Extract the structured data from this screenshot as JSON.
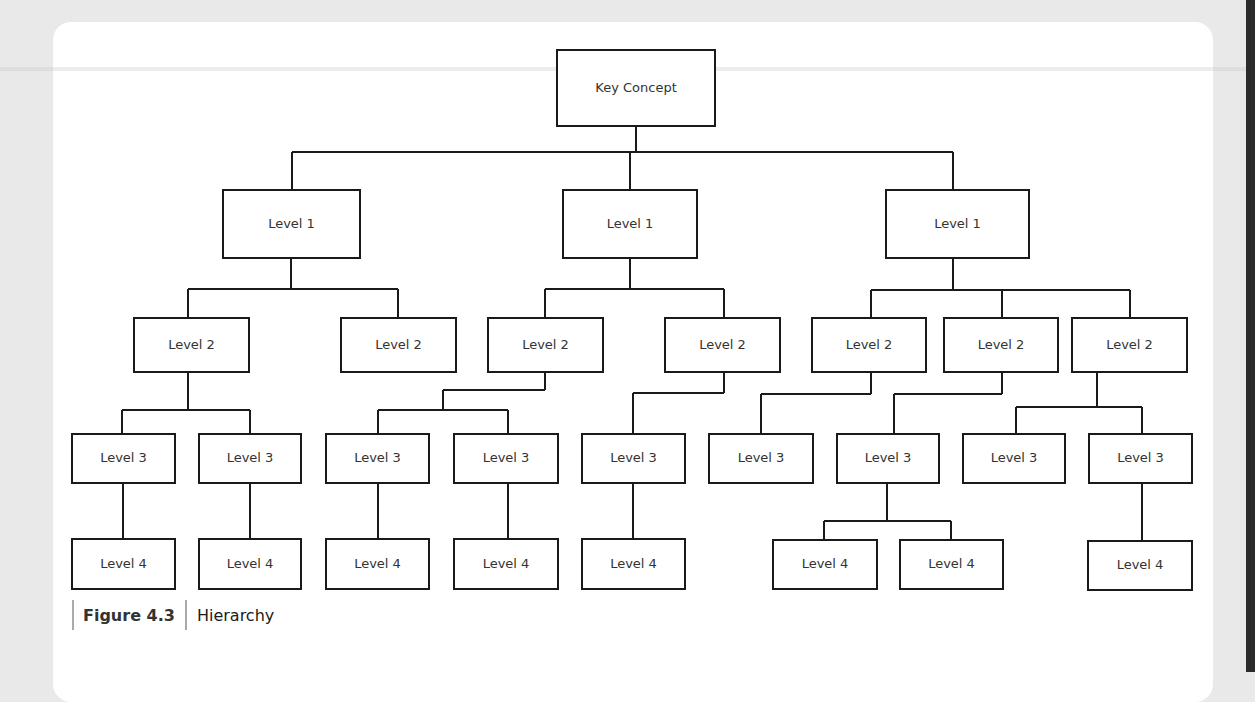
{
  "figure": {
    "label": "Figure 4.3",
    "title": "Hierarchy"
  },
  "diagram": {
    "type": "hierarchy",
    "nodes": [
      {
        "id": "k",
        "label": "Key Concept",
        "x": 557,
        "y": 50,
        "w": 158,
        "h": 76
      },
      {
        "id": "a1",
        "label": "Level 1",
        "x": 223,
        "y": 190,
        "w": 137,
        "h": 68
      },
      {
        "id": "b1",
        "label": "Level 1",
        "x": 563,
        "y": 190,
        "w": 134,
        "h": 68
      },
      {
        "id": "c1",
        "label": "Level 1",
        "x": 886,
        "y": 190,
        "w": 143,
        "h": 68
      },
      {
        "id": "a2a",
        "label": "Level 2",
        "x": 134,
        "y": 318,
        "w": 115,
        "h": 54
      },
      {
        "id": "a2b",
        "label": "Level 2",
        "x": 341,
        "y": 318,
        "w": 115,
        "h": 54
      },
      {
        "id": "b2a",
        "label": "Level 2",
        "x": 488,
        "y": 318,
        "w": 115,
        "h": 54
      },
      {
        "id": "b2b",
        "label": "Level 2",
        "x": 665,
        "y": 318,
        "w": 115,
        "h": 54
      },
      {
        "id": "c2a",
        "label": "Level 2",
        "x": 812,
        "y": 318,
        "w": 114,
        "h": 54
      },
      {
        "id": "c2b",
        "label": "Level 2",
        "x": 944,
        "y": 318,
        "w": 114,
        "h": 54
      },
      {
        "id": "c2c",
        "label": "Level 2",
        "x": 1072,
        "y": 318,
        "w": 115,
        "h": 54
      },
      {
        "id": "a3a",
        "label": "Level 3",
        "x": 72,
        "y": 434,
        "w": 103,
        "h": 49
      },
      {
        "id": "a3b",
        "label": "Level 3",
        "x": 199,
        "y": 434,
        "w": 102,
        "h": 49
      },
      {
        "id": "b3a",
        "label": "Level 3",
        "x": 326,
        "y": 434,
        "w": 103,
        "h": 49
      },
      {
        "id": "b3b",
        "label": "Level 3",
        "x": 454,
        "y": 434,
        "w": 104,
        "h": 49
      },
      {
        "id": "b3c",
        "label": "Level 3",
        "x": 582,
        "y": 434,
        "w": 103,
        "h": 49
      },
      {
        "id": "c3a",
        "label": "Level 3",
        "x": 709,
        "y": 434,
        "w": 104,
        "h": 49
      },
      {
        "id": "c3b",
        "label": "Level 3",
        "x": 837,
        "y": 434,
        "w": 102,
        "h": 49
      },
      {
        "id": "c3c",
        "label": "Level 3",
        "x": 963,
        "y": 434,
        "w": 102,
        "h": 49
      },
      {
        "id": "c3d",
        "label": "Level 3",
        "x": 1089,
        "y": 434,
        "w": 103,
        "h": 49
      },
      {
        "id": "a4a",
        "label": "Level 4",
        "x": 72,
        "y": 539,
        "w": 103,
        "h": 50
      },
      {
        "id": "a4b",
        "label": "Level 4",
        "x": 199,
        "y": 539,
        "w": 102,
        "h": 50
      },
      {
        "id": "b4a",
        "label": "Level 4",
        "x": 326,
        "y": 539,
        "w": 103,
        "h": 50
      },
      {
        "id": "b4b",
        "label": "Level 4",
        "x": 454,
        "y": 539,
        "w": 104,
        "h": 50
      },
      {
        "id": "b4c",
        "label": "Level 4",
        "x": 582,
        "y": 539,
        "w": 103,
        "h": 50
      },
      {
        "id": "c4a",
        "label": "Level 4",
        "x": 773,
        "y": 540,
        "w": 104,
        "h": 49
      },
      {
        "id": "c4b",
        "label": "Level 4",
        "x": 900,
        "y": 540,
        "w": 103,
        "h": 49
      },
      {
        "id": "c4c",
        "label": "Level 4",
        "x": 1088,
        "y": 541,
        "w": 104,
        "h": 49
      }
    ],
    "edges": [
      {
        "d": "M636 126 V152 M292 152 H953 M292 152 V190 M630 152 V190 M953 152 V190"
      },
      {
        "d": "M291 258 V289 M188 289 H398 M188 289 V318 M398 289 V318"
      },
      {
        "d": "M630 258 V289 M545 289 H724 M545 289 V318 M724 289 V318"
      },
      {
        "d": "M953 258 V290 M871 290 H1130 M871 290 V318 M1002 290 V318 M1130 290 V318"
      },
      {
        "d": "M188 372 V410 M122 410 H250 M122 410 V434 M250 410 V434"
      },
      {
        "d": "M545 372 V390 M443 390 H545 M443 390 V410 M378 410 H508 M378 410 V434 M508 410 V434"
      },
      {
        "d": "M724 372 V393 M633 393 H724 M633 393 V434"
      },
      {
        "d": "M871 372 V394 M761 394 H871 M761 394 V434"
      },
      {
        "d": "M1002 372 V394 M894 394 H1002 M894 394 V434"
      },
      {
        "d": "M1097 372 V407 M1016 407 H1142 M1016 407 V434 M1142 407 V434"
      },
      {
        "d": "M123 483 V539 M250 483 V539 M378 483 V539 M508 483 V539 M633 483 V539"
      },
      {
        "d": "M887 483 V521 M824 521 H951 M824 521 V540 M951 521 V540"
      },
      {
        "d": "M1142 483 V541"
      }
    ]
  }
}
